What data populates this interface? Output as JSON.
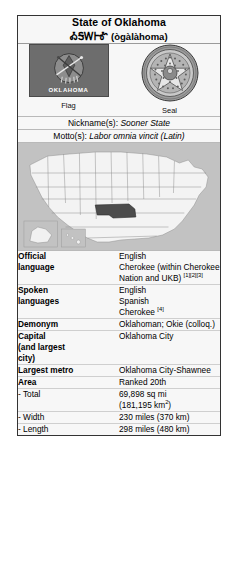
{
  "infobox": {
    "title": {
      "name": "State of Oklahoma",
      "native": "ᎣᎦᎳᎰᎹ",
      "romanized": "(ògàlàhoma)"
    },
    "emblems": {
      "flag": {
        "caption": "Flag",
        "word": "OKLAHOMA",
        "icon": "oklahoma-flag-icon"
      },
      "seal": {
        "caption": "Seal",
        "icon": "oklahoma-seal-icon",
        "ring_text": "GREAT SEAL OF THE STATE OF OKLAHOMA",
        "year": "1907"
      }
    },
    "nickname": {
      "label": "Nickname(s):",
      "value": "Sooner State"
    },
    "motto": {
      "label": "Motto(s):",
      "value": "Labor omnia vincit (Latin)"
    },
    "map": {
      "icon": "us-map-oklahoma-highlighted",
      "highlighted_state": "Oklahoma"
    },
    "rows": [
      {
        "label": "Official language",
        "label_lines": [
          "Official",
          "language"
        ],
        "values": [
          "English",
          "Cherokee (within Cherokee Nation and UKB)"
        ],
        "refs": "[1][2][3]"
      },
      {
        "label": "Spoken languages",
        "label_lines": [
          "Spoken",
          "languages"
        ],
        "values": [
          "English",
          "Spanish",
          "Cherokee"
        ],
        "refs": "[4]"
      },
      {
        "label": "Demonym",
        "values": [
          "Oklahoman; Okie (colloq.)"
        ]
      },
      {
        "label": "Capital (and largest city)",
        "label_lines": [
          "Capital",
          "(and largest",
          "city)"
        ],
        "values": [
          "Oklahoma City"
        ]
      },
      {
        "label": "Largest metro",
        "values": [
          "Oklahoma City-Shawnee"
        ]
      },
      {
        "label": "Area",
        "values": [
          "Ranked 20th"
        ]
      },
      {
        "label": "- Total",
        "values": [
          "69,898 sq mi",
          "(181,195 km2)"
        ]
      },
      {
        "label": "- Width",
        "values": [
          "230 miles (370 km)"
        ]
      },
      {
        "label": "- Length",
        "values": [
          "298 miles (480 km)"
        ]
      }
    ],
    "area": {
      "label": "Area",
      "rank": "Ranked 20th",
      "total_label": "- Total",
      "total_imperial": "69,898 sq mi",
      "total_metric_prefix": "(181,195 km",
      "total_metric_suffix": ")",
      "total_metric_exp": "2",
      "width_label": "- Width",
      "width_value": "230 miles (370 km)",
      "length_label": "- Length",
      "length_value": "298 miles (480 km)"
    },
    "official_language": {
      "label_line1": "Official",
      "label_line2": "language",
      "value_line1": "English",
      "value_line2": "Cherokee (within Cherokee",
      "value_line3": "Nation and UKB)",
      "refs": "[1][2][3]"
    },
    "spoken_languages": {
      "label_line1": "Spoken",
      "label_line2": "languages",
      "value_line1": "English",
      "value_line2": "Spanish",
      "value_line3": "Cherokee",
      "refs": "[4]"
    },
    "demonym": {
      "label": "Demonym",
      "value": "Oklahoman; Okie (colloq.)"
    },
    "capital": {
      "label_line1": "Capital",
      "label_line2": "(and largest",
      "label_line3": "city)",
      "value": "Oklahoma City"
    },
    "largest_metro": {
      "label": "Largest metro",
      "value": "Oklahoma City-Shawnee"
    }
  },
  "colors": {
    "border": "#333333",
    "background": "#f7f7f7",
    "rule": "#cfcfcf",
    "map_land": "#f2f2f2",
    "map_highlight": "#4a4a4a",
    "map_water": "#c2c2c2"
  }
}
